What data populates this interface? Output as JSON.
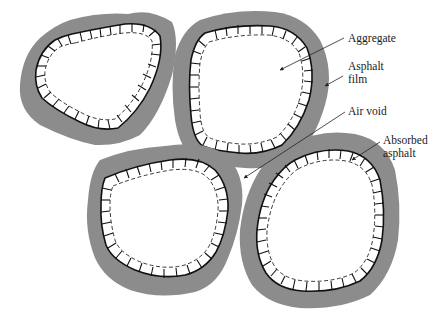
{
  "figure": {
    "type": "schematic cross-section of asphalt-coated aggregate particles",
    "colors": {
      "asphalt_film": "#8c8c8c",
      "aggregate": "#ffffff",
      "outline": "#111111",
      "background": "#ffffff"
    }
  },
  "labels": {
    "aggregate": "Aggregate",
    "asphalt_film_line1": "Asphalt",
    "asphalt_film_line2": "film",
    "air_void": "Air void",
    "absorbed_asphalt_line1": "Absorbed",
    "absorbed_asphalt_line2": "asphalt"
  },
  "particles": [
    {
      "name": "top-left"
    },
    {
      "name": "top-center"
    },
    {
      "name": "bottom-left"
    },
    {
      "name": "bottom-right"
    }
  ]
}
